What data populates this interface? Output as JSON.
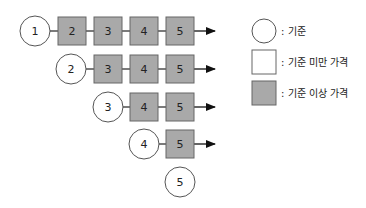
{
  "diagram": {
    "colors": {
      "circle_fill": "#ffffff",
      "below_fill": "#ffffff",
      "above_fill": "#a9a9a9",
      "stroke": "#555555",
      "arrow": "#111111"
    },
    "rows": [
      {
        "base": "1",
        "boxes": [
          "2",
          "3",
          "4",
          "5"
        ],
        "arrow": true
      },
      {
        "base": "2",
        "boxes": [
          "3",
          "4",
          "5"
        ],
        "arrow": true
      },
      {
        "base": "3",
        "boxes": [
          "4",
          "5"
        ],
        "arrow": true
      },
      {
        "base": "4",
        "boxes": [
          "5"
        ],
        "arrow": true
      },
      {
        "base": "5",
        "boxes": [],
        "arrow": false
      }
    ]
  },
  "legend": {
    "items": [
      {
        "shape": "circle",
        "label": ": 기준"
      },
      {
        "shape": "white-square",
        "label": ": 기준 미만 가격"
      },
      {
        "shape": "gray-square",
        "label": ": 기준 이상 가격"
      }
    ]
  }
}
